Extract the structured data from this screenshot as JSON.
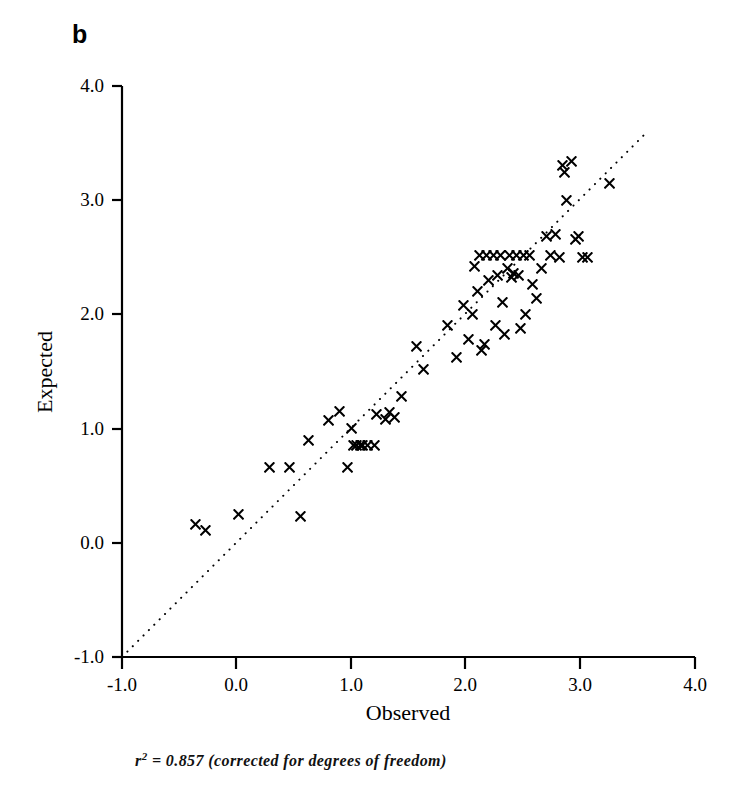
{
  "figure": {
    "panel_label": "b",
    "caption_prefix": "r",
    "caption_superscript": "2",
    "caption_rest": "= 0.857 (corrected for degrees of freedom)",
    "caption_full": "r2 = 0.857 (corrected for degrees of freedom)"
  },
  "chart_data": {
    "type": "scatter",
    "title": "b",
    "xlabel": "Observed",
    "ylabel": "Expected",
    "xlim": [
      -1.0,
      4.0
    ],
    "ylim": [
      -1.0,
      4.0
    ],
    "xticks": [
      "-1.0",
      "0.0",
      "1.0",
      "2.0",
      "3.0",
      "4.0"
    ],
    "yticks": [
      "-1.0",
      "0.0",
      "1.0",
      "2.0",
      "3.0",
      "4.0"
    ],
    "xtick_values": [
      -1.0,
      0.0,
      1.0,
      2.0,
      3.0,
      4.0
    ],
    "ytick_values": [
      -1.0,
      0.0,
      1.0,
      2.0,
      3.0,
      4.0
    ],
    "grid": false,
    "legend": null,
    "marker": "x",
    "marker_color": "#000000",
    "annotation": "r2 = 0.857 (corrected for degrees of freedom)",
    "r_squared": 0.857,
    "reference_line": {
      "type": "identity",
      "style": "dotted",
      "from": [
        -1.0,
        -1.0
      ],
      "to": [
        3.6,
        3.6
      ],
      "label": "1:1 line"
    },
    "points": [
      [
        -0.36,
        0.16
      ],
      [
        -0.27,
        0.11
      ],
      [
        0.02,
        0.25
      ],
      [
        0.56,
        0.23
      ],
      [
        0.29,
        0.66
      ],
      [
        0.46,
        0.66
      ],
      [
        0.63,
        0.9
      ],
      [
        0.8,
        1.07
      ],
      [
        0.9,
        1.15
      ],
      [
        0.97,
        0.66
      ],
      [
        1.0,
        1.0
      ],
      [
        1.02,
        0.85
      ],
      [
        1.05,
        0.85
      ],
      [
        1.08,
        0.85
      ],
      [
        1.1,
        0.85
      ],
      [
        1.14,
        0.85
      ],
      [
        1.2,
        0.85
      ],
      [
        1.22,
        1.12
      ],
      [
        1.3,
        1.08
      ],
      [
        1.33,
        1.14
      ],
      [
        1.38,
        1.1
      ],
      [
        1.44,
        1.28
      ],
      [
        1.57,
        1.72
      ],
      [
        1.63,
        1.52
      ],
      [
        1.84,
        1.9
      ],
      [
        1.92,
        1.62
      ],
      [
        1.98,
        2.08
      ],
      [
        2.02,
        1.78
      ],
      [
        2.06,
        2.0
      ],
      [
        2.08,
        2.42
      ],
      [
        2.1,
        2.2
      ],
      [
        2.12,
        2.52
      ],
      [
        2.14,
        1.68
      ],
      [
        2.16,
        1.74
      ],
      [
        2.18,
        2.52
      ],
      [
        2.2,
        2.3
      ],
      [
        2.24,
        2.52
      ],
      [
        2.26,
        1.9
      ],
      [
        2.28,
        2.34
      ],
      [
        2.3,
        2.52
      ],
      [
        2.32,
        2.1
      ],
      [
        2.34,
        1.82
      ],
      [
        2.36,
        2.4
      ],
      [
        2.38,
        2.52
      ],
      [
        2.4,
        2.32
      ],
      [
        2.42,
        2.36
      ],
      [
        2.44,
        2.52
      ],
      [
        2.46,
        2.34
      ],
      [
        2.48,
        1.88
      ],
      [
        2.5,
        2.52
      ],
      [
        2.52,
        2.0
      ],
      [
        2.56,
        2.52
      ],
      [
        2.58,
        2.26
      ],
      [
        2.62,
        2.14
      ],
      [
        2.66,
        2.4
      ],
      [
        2.7,
        2.68
      ],
      [
        2.74,
        2.52
      ],
      [
        2.78,
        2.7
      ],
      [
        2.82,
        2.5
      ],
      [
        2.84,
        3.3
      ],
      [
        2.86,
        3.24
      ],
      [
        2.88,
        3.0
      ],
      [
        2.92,
        3.34
      ],
      [
        2.96,
        2.66
      ],
      [
        2.98,
        2.68
      ],
      [
        3.02,
        2.5
      ],
      [
        3.06,
        2.5
      ],
      [
        3.25,
        3.15
      ]
    ]
  }
}
